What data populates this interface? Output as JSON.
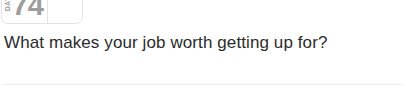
{
  "badge": {
    "day_label": "DAY",
    "day_number": "74",
    "empty_cell_value": ""
  },
  "prompt": {
    "question": "What makes your job worth getting up for?"
  },
  "colors": {
    "background": "#ffffff",
    "badge_border": "#e3e3e3",
    "badge_text": "#9d9d9d",
    "question_text": "#2b2b2b",
    "divider": "#ececec"
  }
}
